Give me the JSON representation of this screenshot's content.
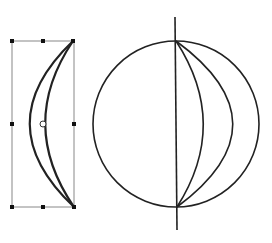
{
  "diagram": {
    "colors": {
      "stroke": "#222222",
      "bbox": "#777777",
      "handle": "#111111",
      "background": "#ffffff"
    },
    "left_shape": {
      "name": "crescent-shape",
      "selected": true,
      "handles": [
        "top-left",
        "top-middle",
        "top-right",
        "middle-left",
        "middle-right",
        "bottom-left",
        "bottom-middle",
        "bottom-right"
      ],
      "center_marker": "rotation-center"
    },
    "right_shape": {
      "name": "sphere",
      "meridian_arcs": 2,
      "axis": "vertical"
    }
  }
}
